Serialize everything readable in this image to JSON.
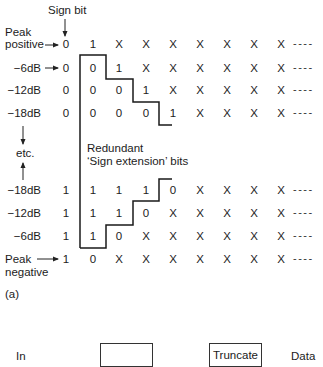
{
  "figure": {
    "part_label": "(a)",
    "sign_bit_label": "Sign bit",
    "annotation": {
      "line1": "Redundant",
      "line2": "‘Sign extension’ bits"
    },
    "etc_label": "etc.",
    "continuation": "----",
    "columns_x": [
      66,
      93,
      119,
      146,
      173,
      200,
      227,
      254,
      281
    ],
    "rows": [
      {
        "label_line1": "Peak",
        "label_line2": "positive",
        "has_arrow": true,
        "y": 44,
        "bits": [
          "0",
          "1",
          "X",
          "X",
          "X",
          "X",
          "X",
          "X",
          "X"
        ]
      },
      {
        "label": "−6dB",
        "has_arrow": true,
        "y": 68,
        "bits": [
          "0",
          "0",
          "1",
          "X",
          "X",
          "X",
          "X",
          "X",
          "X"
        ]
      },
      {
        "label": "−12dB",
        "has_arrow": false,
        "y": 90,
        "bits": [
          "0",
          "0",
          "0",
          "1",
          "X",
          "X",
          "X",
          "X",
          "X"
        ]
      },
      {
        "label": "−18dB",
        "has_arrow": false,
        "y": 113,
        "bits": [
          "0",
          "0",
          "0",
          "0",
          "1",
          "X",
          "X",
          "X",
          "X"
        ]
      },
      {
        "label": "−18dB",
        "has_arrow": false,
        "y": 190,
        "bits": [
          "1",
          "1",
          "1",
          "1",
          "0",
          "X",
          "X",
          "X",
          "X"
        ]
      },
      {
        "label": "−12dB",
        "has_arrow": false,
        "y": 213,
        "bits": [
          "1",
          "1",
          "1",
          "0",
          "X",
          "X",
          "X",
          "X",
          "X"
        ]
      },
      {
        "label": "−6dB",
        "has_arrow": false,
        "y": 236,
        "bits": [
          "1",
          "1",
          "0",
          "X",
          "X",
          "X",
          "X",
          "X",
          "X"
        ]
      },
      {
        "label_line1": "Peak",
        "label_line2": "negative",
        "has_arrow": true,
        "y": 259,
        "bits": [
          "1",
          "0",
          "X",
          "X",
          "X",
          "X",
          "X",
          "X",
          "X"
        ]
      }
    ]
  },
  "lower_diagram": {
    "in_label": "In",
    "box1_label": "",
    "box2_label": "Truncate",
    "data_label": "Data"
  }
}
